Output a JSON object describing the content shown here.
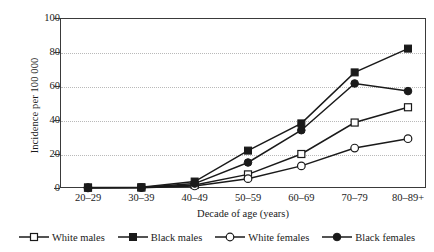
{
  "chart_data": {
    "type": "line",
    "title": "",
    "xlabel": "Decade of age (years)",
    "ylabel": "Incidence per 100 000",
    "categories": [
      "20–29",
      "30–39",
      "40–49",
      "50–59",
      "60–69",
      "70–79",
      "80–89+"
    ],
    "ylim": [
      0,
      100
    ],
    "yticks": [
      0,
      20,
      40,
      60,
      80,
      100
    ],
    "grid": true,
    "legend_position": "bottom",
    "series": [
      {
        "name": "White males",
        "marker": "open-square",
        "color": "#1a1a1a",
        "values": [
          0.2,
          0.3,
          1.8,
          8.0,
          20.0,
          38.5,
          47.5
        ]
      },
      {
        "name": "Black males",
        "marker": "filled-square",
        "color": "#1a1a1a",
        "values": [
          0.3,
          0.4,
          3.8,
          22.0,
          38.0,
          68.0,
          82.0
        ]
      },
      {
        "name": "White females",
        "marker": "open-circle",
        "color": "#1a1a1a",
        "values": [
          0.1,
          0.2,
          1.2,
          5.5,
          13.0,
          23.5,
          29.0
        ]
      },
      {
        "name": "Black females",
        "marker": "filled-circle",
        "color": "#1a1a1a",
        "values": [
          0.2,
          0.3,
          2.6,
          15.0,
          34.0,
          61.5,
          57.0
        ]
      }
    ]
  },
  "legend": {
    "items": [
      {
        "label": "White males"
      },
      {
        "label": "Black males"
      },
      {
        "label": "White females"
      },
      {
        "label": "Black females"
      }
    ]
  },
  "colors": {
    "axis": "#3a3a3a",
    "grid": "#b9b9b9",
    "series": "#1a1a1a",
    "background": "#ffffff"
  }
}
